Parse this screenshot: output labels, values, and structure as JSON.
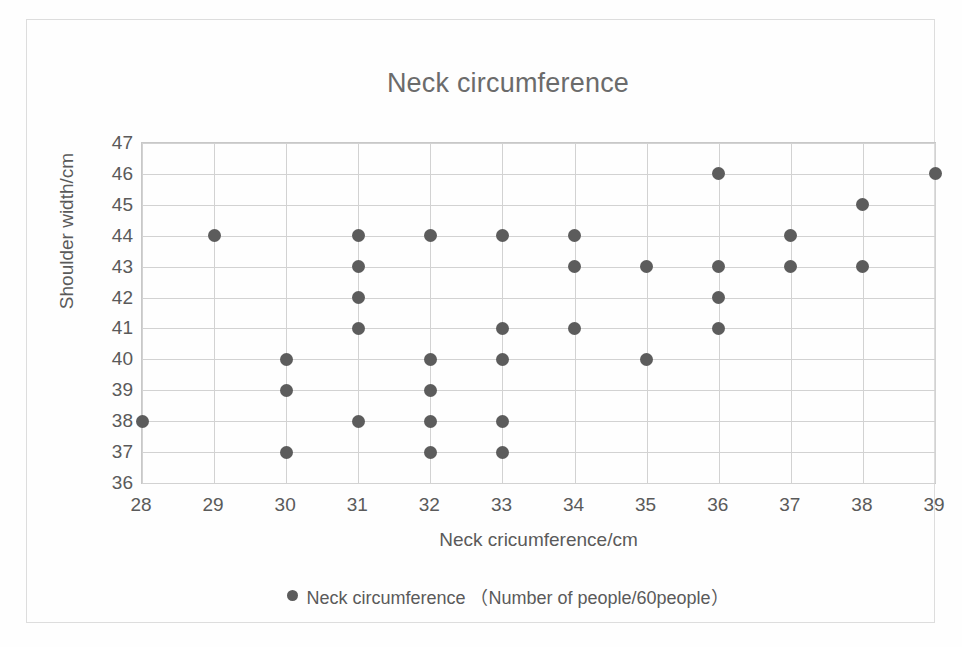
{
  "chart_data": {
    "type": "scatter",
    "title": "Neck circumference",
    "xlabel": "Neck cricumference/cm",
    "ylabel": "Shoulder width/cm",
    "xlim": [
      28,
      39
    ],
    "ylim": [
      36,
      47
    ],
    "xticks": [
      28,
      29,
      30,
      31,
      32,
      33,
      34,
      35,
      36,
      37,
      38,
      39
    ],
    "yticks": [
      36,
      37,
      38,
      39,
      40,
      41,
      42,
      43,
      44,
      45,
      46,
      47
    ],
    "grid": true,
    "legend_position": "bottom",
    "series": [
      {
        "name": "Neck circumference （Number of people/60people）",
        "marker_color": "#5c5c5c",
        "points": [
          [
            28,
            38
          ],
          [
            29,
            44
          ],
          [
            30,
            40
          ],
          [
            30,
            39
          ],
          [
            30,
            37
          ],
          [
            31,
            44
          ],
          [
            31,
            43
          ],
          [
            31,
            42
          ],
          [
            31,
            41
          ],
          [
            31,
            38
          ],
          [
            32,
            44
          ],
          [
            32,
            40
          ],
          [
            32,
            39
          ],
          [
            32,
            38
          ],
          [
            32,
            37
          ],
          [
            33,
            44
          ],
          [
            33,
            41
          ],
          [
            33,
            40
          ],
          [
            33,
            38
          ],
          [
            33,
            37
          ],
          [
            34,
            44
          ],
          [
            34,
            43
          ],
          [
            34,
            41
          ],
          [
            35,
            43
          ],
          [
            35,
            40
          ],
          [
            36,
            46
          ],
          [
            36,
            43
          ],
          [
            36,
            42
          ],
          [
            36,
            41
          ],
          [
            37,
            44
          ],
          [
            37,
            43
          ],
          [
            38,
            45
          ],
          [
            38,
            43
          ],
          [
            39,
            46
          ]
        ]
      }
    ]
  },
  "legend": {
    "marker": "filled-circle-marker",
    "label": "Neck circumference （Number of people/60people）"
  },
  "colors": {
    "marker": "#5c5c5c",
    "gridline": "#d2d2d2",
    "plot_border": "#c8c8c8",
    "chart_border": "#dddddd",
    "text": "#5a5a5a",
    "title_text": "#6b6b6b"
  }
}
